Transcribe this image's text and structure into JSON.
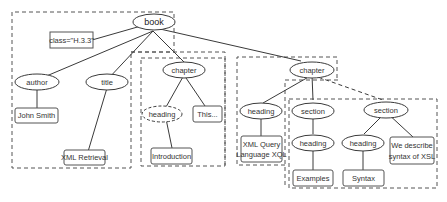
{
  "diagram": {
    "title": "",
    "nodes": {
      "book": {
        "label": "book",
        "type": "element"
      },
      "attr": {
        "label": "class=\"H.3.3\"",
        "type": "attribute"
      },
      "author": {
        "label": "author",
        "type": "element"
      },
      "title": {
        "label": "title",
        "type": "element"
      },
      "john": {
        "label": "John Smith",
        "type": "text"
      },
      "xmlret": {
        "label": "XML Retrieval",
        "type": "text"
      },
      "chapter1": {
        "label": "chapter",
        "type": "element"
      },
      "heading1": {
        "label": "heading",
        "type": "element-dashed"
      },
      "this": {
        "label": "This...",
        "type": "text"
      },
      "intro": {
        "label": "Introduction",
        "type": "text"
      },
      "chapter2": {
        "label": "chapter",
        "type": "element"
      },
      "heading2": {
        "label": "heading",
        "type": "element"
      },
      "xql1": {
        "label": "XML Query",
        "type": "text"
      },
      "xql2": {
        "label": "Language XQL",
        "type": "text"
      },
      "section1": {
        "label": "section",
        "type": "element"
      },
      "heading3": {
        "label": "heading",
        "type": "element"
      },
      "examples": {
        "label": "Examples",
        "type": "text"
      },
      "section2": {
        "label": "section",
        "type": "element"
      },
      "heading4": {
        "label": "heading",
        "type": "element"
      },
      "syntax": {
        "label": "Syntax",
        "type": "text"
      },
      "desc1": {
        "label": "We describe",
        "type": "text"
      },
      "desc2": {
        "label": "syntax of XSL",
        "type": "text"
      }
    },
    "edges": [
      [
        "book",
        "attr"
      ],
      [
        "book",
        "author"
      ],
      [
        "book",
        "title"
      ],
      [
        "book",
        "chapter1"
      ],
      [
        "book",
        "chapter2"
      ],
      [
        "author",
        "john"
      ],
      [
        "title",
        "xmlret"
      ],
      [
        "chapter1",
        "heading1"
      ],
      [
        "chapter1",
        "this"
      ],
      [
        "heading1",
        "intro"
      ],
      [
        "chapter2",
        "heading2"
      ],
      [
        "chapter2",
        "section1"
      ],
      [
        "chapter2",
        "section2",
        "dashed"
      ],
      [
        "heading2",
        "xql"
      ],
      [
        "section1",
        "heading3"
      ],
      [
        "heading3",
        "examples"
      ],
      [
        "section2",
        "heading4"
      ],
      [
        "section2",
        "desc"
      ],
      [
        "heading4",
        "syntax"
      ]
    ],
    "regions": 6
  }
}
